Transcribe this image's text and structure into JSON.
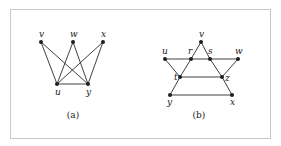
{
  "figure": {
    "frame": {
      "x": 10,
      "y": 9,
      "width": 260,
      "height": 129
    },
    "graphs": [
      {
        "id": "a",
        "caption": "(a)",
        "caption_pos": {
          "x": 73,
          "y": 118
        },
        "vertices": [
          {
            "id": "v",
            "label": "v",
            "x": 41,
            "y": 42,
            "lx": 39,
            "ly": 37
          },
          {
            "id": "w",
            "label": "w",
            "x": 73,
            "y": 42,
            "lx": 70,
            "ly": 37
          },
          {
            "id": "x",
            "label": "x",
            "x": 103,
            "y": 42,
            "lx": 101,
            "ly": 37
          },
          {
            "id": "u",
            "label": "u",
            "x": 57,
            "y": 84,
            "lx": 55,
            "ly": 95
          },
          {
            "id": "y",
            "label": "y",
            "x": 88,
            "y": 84,
            "lx": 86,
            "ly": 95
          }
        ],
        "edges": [
          [
            "v",
            "u"
          ],
          [
            "v",
            "y"
          ],
          [
            "w",
            "u"
          ],
          [
            "w",
            "y"
          ],
          [
            "x",
            "u"
          ],
          [
            "x",
            "y"
          ],
          [
            "u",
            "y"
          ]
        ]
      },
      {
        "id": "b",
        "caption": "(b)",
        "caption_pos": {
          "x": 199,
          "y": 118
        },
        "vertices": [
          {
            "id": "v",
            "label": "v",
            "x": 201,
            "y": 42,
            "lx": 199,
            "ly": 37
          },
          {
            "id": "u",
            "label": "u",
            "x": 165,
            "y": 59,
            "lx": 162,
            "ly": 54
          },
          {
            "id": "r",
            "label": "r",
            "x": 191,
            "y": 59,
            "lx": 188,
            "ly": 54
          },
          {
            "id": "s",
            "label": "s",
            "x": 210,
            "y": 59,
            "lx": 208,
            "ly": 54
          },
          {
            "id": "w",
            "label": "w",
            "x": 238,
            "y": 59,
            "lx": 235,
            "ly": 54
          },
          {
            "id": "t",
            "label": "t",
            "x": 180,
            "y": 77,
            "lx": 174,
            "ly": 80
          },
          {
            "id": "z",
            "label": "z",
            "x": 222,
            "y": 77,
            "lx": 225,
            "ly": 81
          },
          {
            "id": "y",
            "label": "y",
            "x": 170,
            "y": 95,
            "lx": 167,
            "ly": 105
          },
          {
            "id": "x",
            "label": "x",
            "x": 232,
            "y": 95,
            "lx": 230,
            "ly": 105
          }
        ],
        "edges": [
          [
            "v",
            "r"
          ],
          [
            "r",
            "t"
          ],
          [
            "t",
            "y"
          ],
          [
            "v",
            "s"
          ],
          [
            "s",
            "z"
          ],
          [
            "z",
            "x"
          ],
          [
            "u",
            "r"
          ],
          [
            "r",
            "s"
          ],
          [
            "s",
            "w"
          ],
          [
            "u",
            "t"
          ],
          [
            "t",
            "z"
          ],
          [
            "w",
            "z"
          ],
          [
            "y",
            "x"
          ]
        ]
      }
    ]
  }
}
